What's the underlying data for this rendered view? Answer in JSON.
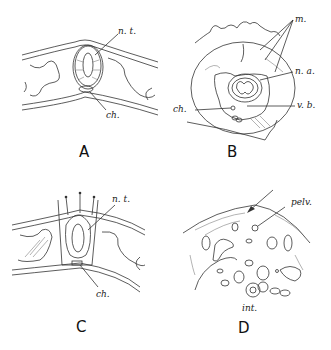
{
  "panels": [
    {
      "id": "A",
      "letter": "A",
      "labels": {
        "nt": "n. t.",
        "ch": "ch."
      }
    },
    {
      "id": "B",
      "letter": "B",
      "labels": {
        "m": "m.",
        "na": "n. a.",
        "ch": "ch.",
        "vb": "v. b."
      }
    },
    {
      "id": "C",
      "letter": "C",
      "labels": {
        "nt": "n. t.",
        "ch": "ch."
      }
    },
    {
      "id": "D",
      "letter": "D",
      "labels": {
        "pelv": "pelv.",
        "int": "int."
      }
    }
  ]
}
